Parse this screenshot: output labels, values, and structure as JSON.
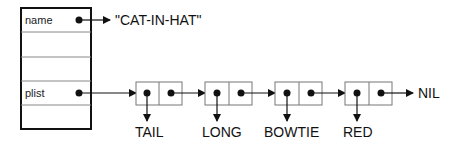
{
  "record": {
    "fields": [
      {
        "label": "name",
        "has_pointer": true
      },
      {
        "label": "",
        "has_pointer": false
      },
      {
        "label": "",
        "has_pointer": false
      },
      {
        "label": "plist",
        "has_pointer": true
      },
      {
        "label": "",
        "has_pointer": false
      }
    ]
  },
  "name_value": "\"CAT-IN-HAT\"",
  "plist": {
    "cells": [
      {
        "car": "TAIL"
      },
      {
        "car": "LONG"
      },
      {
        "car": "BOWTIE"
      },
      {
        "car": "RED"
      }
    ],
    "terminator": "NIL"
  },
  "colors": {
    "line": "#111111",
    "cell_border": "#777777",
    "record_border": "#111111"
  }
}
